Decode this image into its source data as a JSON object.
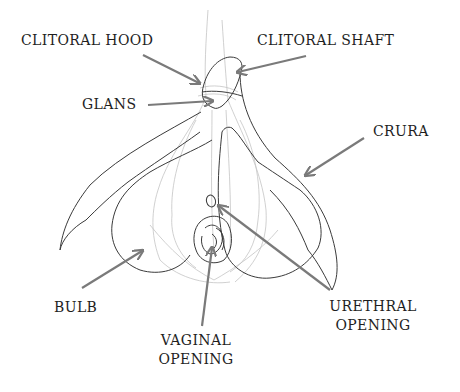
{
  "diagram": {
    "title": "",
    "colors": {
      "background": "#ffffff",
      "outline": "#3a3a3a",
      "faint_lines": "#bdbdbd",
      "arrow": "#7a7a7a",
      "label_text": "#1e1e1e"
    },
    "labels": {
      "clitoral_hood": "CLITORAL HOOD",
      "clitoral_shaft": "CLITORAL SHAFT",
      "glans": "GLANS",
      "crura": "CRURA",
      "bulb": "BULB",
      "vaginal_opening_line1": "VAGINAL",
      "vaginal_opening_line2": "OPENING",
      "urethral_opening_line1": "URETHRAL",
      "urethral_opening_line2": "OPENING"
    }
  }
}
